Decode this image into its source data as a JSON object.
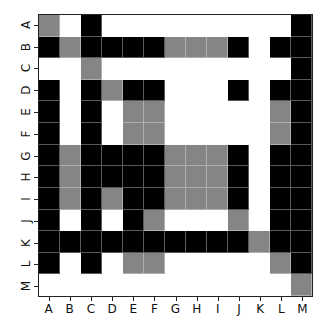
{
  "chart_data": {
    "type": "heatmap",
    "title": "",
    "xlabel": "",
    "ylabel": "",
    "x_labels": [
      "A",
      "B",
      "C",
      "D",
      "E",
      "F",
      "G",
      "H",
      "I",
      "J",
      "K",
      "L",
      "M"
    ],
    "y_labels": [
      "A",
      "B",
      "C",
      "D",
      "E",
      "F",
      "G",
      "H",
      "I",
      "J",
      "K",
      "L",
      "M"
    ],
    "value_legend": {
      "0": "white",
      "1": "gray",
      "2": "black"
    },
    "colors": {
      "0": "#ffffff",
      "1": "#858585",
      "2": "#000000"
    },
    "matrix": [
      [
        1,
        0,
        2,
        0,
        0,
        0,
        0,
        0,
        0,
        0,
        0,
        0,
        2
      ],
      [
        2,
        1,
        2,
        2,
        2,
        2,
        1,
        1,
        1,
        2,
        0,
        2,
        2
      ],
      [
        0,
        0,
        1,
        0,
        0,
        0,
        0,
        0,
        0,
        0,
        0,
        0,
        2
      ],
      [
        2,
        0,
        2,
        1,
        2,
        2,
        0,
        0,
        0,
        2,
        0,
        2,
        2
      ],
      [
        2,
        0,
        2,
        0,
        1,
        1,
        0,
        0,
        0,
        0,
        0,
        1,
        2
      ],
      [
        2,
        0,
        2,
        0,
        1,
        1,
        0,
        0,
        0,
        0,
        0,
        1,
        2
      ],
      [
        2,
        1,
        2,
        2,
        2,
        2,
        1,
        1,
        1,
        2,
        0,
        2,
        2
      ],
      [
        2,
        1,
        2,
        2,
        2,
        2,
        1,
        1,
        1,
        2,
        0,
        2,
        2
      ],
      [
        2,
        1,
        2,
        1,
        2,
        2,
        1,
        1,
        1,
        2,
        0,
        2,
        2
      ],
      [
        2,
        0,
        2,
        0,
        2,
        1,
        0,
        0,
        0,
        1,
        0,
        2,
        2
      ],
      [
        2,
        2,
        2,
        2,
        2,
        2,
        2,
        2,
        2,
        2,
        1,
        2,
        2
      ],
      [
        2,
        0,
        2,
        0,
        1,
        1,
        0,
        0,
        0,
        0,
        0,
        1,
        2
      ],
      [
        0,
        0,
        0,
        0,
        0,
        0,
        0,
        0,
        0,
        0,
        0,
        0,
        1
      ]
    ],
    "grid": false,
    "legend": "none"
  }
}
